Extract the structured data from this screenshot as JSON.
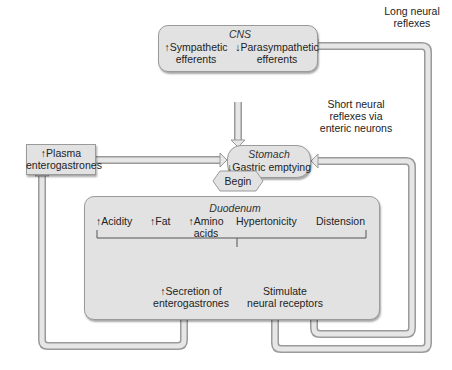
{
  "cns": {
    "title": "CNS",
    "left": "↑Sympathetic",
    "left2": "efferents",
    "right": "↓Parasympathetic",
    "right2": "efferents"
  },
  "stomach": {
    "title": "Stomach",
    "effect": "↓Gastric emptying"
  },
  "plasma": {
    "line1": "↑Plasma",
    "line2": "enterogastrones"
  },
  "begin": {
    "label": "Begin"
  },
  "duodenum": {
    "title": "Duodenum",
    "stimuli": [
      "↑Acidity",
      "↑Fat",
      "↑Amino",
      "acids",
      "Hypertonicity",
      "Distension"
    ],
    "outputs": {
      "left1": "↑Secretion of",
      "left2": "enterogastrones",
      "right1": "Stimulate",
      "right2": "neural receptors"
    }
  },
  "notes": {
    "long1": "Long neural",
    "long2": "reflexes",
    "short1": "Short neural",
    "short2": "reflexes via",
    "short3": "enteric neurons"
  },
  "colors": {
    "box_fill": "#e2e2e2",
    "box_border": "#9a9a9a",
    "pipe_outer": "#9a9a9a",
    "pipe_inner": "#e4e4e4"
  }
}
